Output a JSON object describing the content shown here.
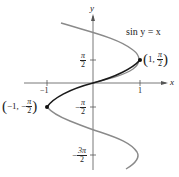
{
  "figure": {
    "equation": "sin y = x",
    "x_axis_label": "x",
    "y_axis_label": "y",
    "x_ticks": [
      {
        "value": -1,
        "label": "−1"
      },
      {
        "value": 1,
        "label": "1"
      }
    ],
    "y_ticks": [
      {
        "value": "π/2",
        "num": "π",
        "den": "2",
        "sign": ""
      },
      {
        "value": "-π/2",
        "num": "π",
        "den": "2",
        "sign": "−"
      },
      {
        "value": "-3π/2",
        "num": "3π",
        "den": "2",
        "sign": "−"
      }
    ],
    "points": [
      {
        "name": "max",
        "x_text": "1",
        "y_num": "π",
        "y_den": "2",
        "y_sign": ""
      },
      {
        "name": "min",
        "x_text": "−1",
        "y_num": "π",
        "y_den": "2",
        "y_sign": "−"
      }
    ],
    "colors": {
      "axis": "#555555",
      "curve_gray": "#8a8a8a",
      "curve_black": "#1a1a1a"
    }
  }
}
